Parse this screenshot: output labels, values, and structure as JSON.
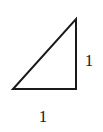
{
  "figure": {
    "kind": "right-triangle-diagram",
    "background_color": "#ffffff",
    "stroke_color": "#1a1a1a",
    "stroke_width": 2,
    "canvas": {
      "width": 103,
      "height": 132
    },
    "shape": {
      "name": "right triangle",
      "right_angle_at": "bottom-right",
      "vertices": {
        "apex": {
          "x": 76,
          "y": 19
        },
        "bottom_right": {
          "x": 76,
          "y": 89
        },
        "bottom_left": {
          "x": 13,
          "y": 89
        }
      },
      "path": "M 13 89 L 76 89 L 76 19 Z"
    },
    "labels": {
      "vertical_leg": "1",
      "horizontal_leg": "1"
    }
  }
}
